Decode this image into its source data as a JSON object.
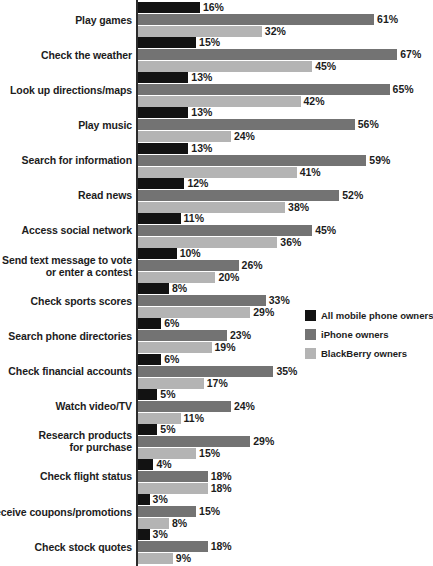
{
  "chart_data": {
    "type": "bar",
    "orientation": "horizontal",
    "title": "",
    "subtitle": "",
    "xlabel": "",
    "ylabel": "",
    "xlim": [
      0,
      70
    ],
    "grid": false,
    "legend_position": "middle-right",
    "value_suffix": "%",
    "categories": [
      "Play games",
      "Check the weather",
      "Look up directions/maps",
      "Play music",
      "Search for information",
      "Read news",
      "Access social network",
      "Send text message to vote\nor enter a contest",
      "Check sports scores",
      "Search phone directories",
      "Check financial accounts",
      "Watch video/TV",
      "Research products\nfor purchase",
      "Check flight status",
      "Receive coupons/promotions",
      "Check stock quotes"
    ],
    "series": [
      {
        "name": "All mobile phone owners",
        "color": "#121212",
        "values": [
          16,
          15,
          13,
          13,
          13,
          12,
          11,
          10,
          8,
          6,
          6,
          5,
          5,
          4,
          3,
          3
        ],
        "labels": [
          "16%",
          "15%",
          "13%",
          "13%",
          "13%",
          "12%",
          "11%",
          "10%",
          "8%",
          "6%",
          "6%",
          "5%",
          "5%",
          "4%",
          "3%",
          "3%"
        ]
      },
      {
        "name": "iPhone owners",
        "color": "#737373",
        "values": [
          61,
          67,
          65,
          56,
          59,
          52,
          45,
          26,
          33,
          23,
          35,
          24,
          29,
          18,
          15,
          18
        ],
        "labels": [
          "61%",
          "67%",
          "65%",
          "56%",
          "59%",
          "52%",
          "45%",
          "26%",
          "33%",
          "23%",
          "35%",
          "24%",
          "29%",
          "18%",
          "15%",
          "18%"
        ]
      },
      {
        "name": "BlackBerry owners",
        "color": "#b4b4b4",
        "values": [
          32,
          45,
          42,
          24,
          41,
          38,
          36,
          20,
          29,
          19,
          17,
          11,
          15,
          18,
          8,
          9
        ],
        "labels": [
          "32%",
          "45%",
          "42%",
          "24%",
          "41%",
          "38%",
          "36%",
          "20%",
          "29%",
          "19%",
          "17%",
          "11%",
          "15%",
          "18%",
          "8%",
          "9%"
        ]
      }
    ]
  },
  "legend": {
    "items": [
      {
        "label": "All mobile phone owners",
        "swatch": "s0"
      },
      {
        "label": "iPhone owners",
        "swatch": "s1"
      },
      {
        "label": "BlackBerry owners",
        "swatch": "s2"
      }
    ]
  }
}
